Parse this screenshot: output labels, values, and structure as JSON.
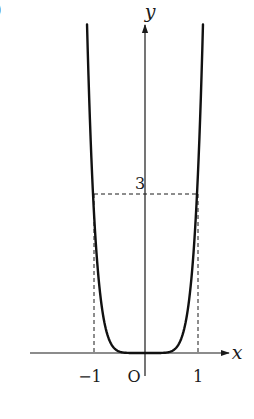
{
  "figure": {
    "partial_label": ")"
  },
  "chart_data": {
    "type": "line",
    "title": "",
    "xlabel": "x",
    "ylabel": "y",
    "origin_label": "O",
    "x_ticks": [
      {
        "value": -1,
        "label": "−1"
      },
      {
        "value": 1,
        "label": "1"
      }
    ],
    "y_ticks": [
      {
        "value": 3,
        "label": "3"
      }
    ],
    "reference_lines": [
      {
        "type": "horizontal",
        "y": 3,
        "x_from": -1,
        "x_to": 1,
        "style": "dashed"
      },
      {
        "type": "vertical",
        "x": -1,
        "y_from": 0,
        "y_to": 3,
        "style": "dashed"
      },
      {
        "type": "vertical",
        "x": 1,
        "y_from": 0,
        "y_to": 3,
        "style": "dashed"
      }
    ],
    "series": [
      {
        "name": "curve",
        "description": "even function, flat near origin, y = 3 at x = ±1",
        "points": [
          {
            "x": -1.115,
            "y": 6.2
          },
          {
            "x": -1.0,
            "y": 3.0
          },
          {
            "x": -0.8,
            "y": 0.67
          },
          {
            "x": -0.6,
            "y": 0.098
          },
          {
            "x": -0.4,
            "y": 0.007
          },
          {
            "x": 0.0,
            "y": 0.0
          },
          {
            "x": 0.4,
            "y": 0.007
          },
          {
            "x": 0.6,
            "y": 0.098
          },
          {
            "x": 0.8,
            "y": 0.67
          },
          {
            "x": 1.0,
            "y": 3.0
          },
          {
            "x": 1.115,
            "y": 6.2
          }
        ]
      }
    ],
    "xlim": [
      -2.2,
      1.6
    ],
    "ylim": [
      -1.2,
      6.4
    ],
    "grid": false,
    "legend": null
  }
}
